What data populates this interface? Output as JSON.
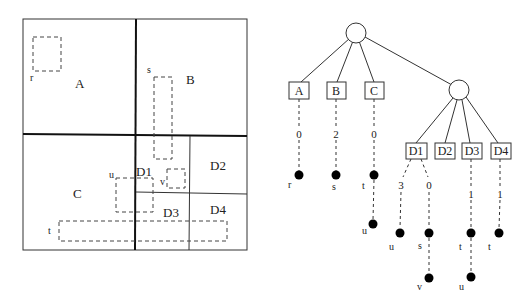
{
  "space_partition": {
    "regions": [
      {
        "id": "A",
        "label": "A"
      },
      {
        "id": "B",
        "label": "B"
      },
      {
        "id": "C",
        "label": "C"
      },
      {
        "id": "D1",
        "label": "D1"
      },
      {
        "id": "D2",
        "label": "D2"
      },
      {
        "id": "D3",
        "label": "D3"
      },
      {
        "id": "D4",
        "label": "D4"
      }
    ],
    "objects": [
      {
        "id": "r",
        "label": "r"
      },
      {
        "id": "s",
        "label": "s"
      },
      {
        "id": "u",
        "label": "u"
      },
      {
        "id": "v",
        "label": "v"
      },
      {
        "id": "t",
        "label": "t"
      }
    ]
  },
  "tree": {
    "root": {
      "type": "internal-node"
    },
    "level1": [
      {
        "label": "A",
        "edge_label": "0",
        "objects": [
          "r"
        ]
      },
      {
        "label": "B",
        "edge_label": "2",
        "objects": [
          "s"
        ]
      },
      {
        "label": "C",
        "edge_label": "0",
        "objects": [
          "t",
          "u"
        ]
      }
    ],
    "inner": {
      "type": "internal-node"
    },
    "level2": [
      {
        "label": "D1",
        "edges": [
          {
            "edge_label": "3",
            "objects": [
              "u"
            ]
          },
          {
            "edge_label": "0",
            "objects": [
              "s",
              "v"
            ]
          }
        ]
      },
      {
        "label": "D2"
      },
      {
        "label": "D3",
        "edge_label": "1",
        "objects": [
          "t",
          "u"
        ]
      },
      {
        "label": "D4",
        "edge_label": "1",
        "objects": [
          "t"
        ]
      }
    ]
  }
}
